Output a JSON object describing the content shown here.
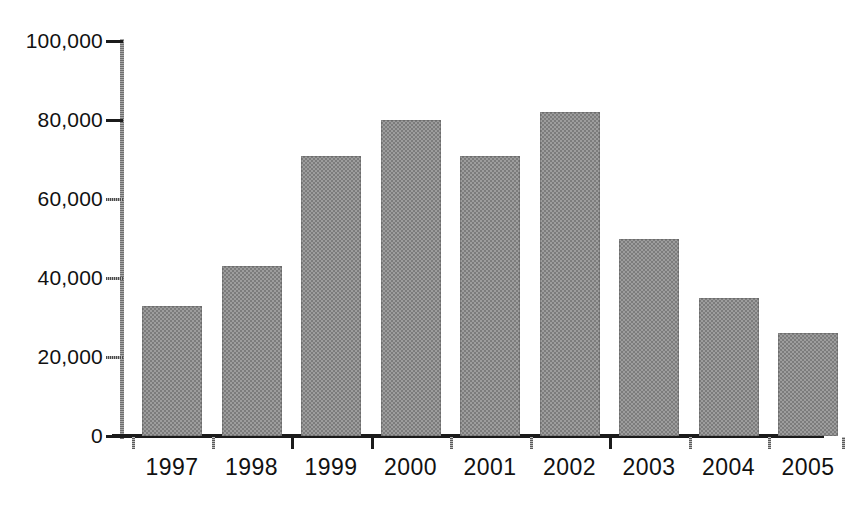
{
  "chart_data": {
    "type": "bar",
    "title": "",
    "subtitle": "",
    "xlabel": "",
    "ylabel": "",
    "categories": [
      "1997",
      "1998",
      "1999",
      "2000",
      "2001",
      "2002",
      "2003",
      "2004",
      "2005"
    ],
    "values": [
      33000,
      43000,
      71000,
      80000,
      71000,
      82000,
      50000,
      35000,
      26000
    ],
    "series": [
      {
        "name": "",
        "values": [
          33000,
          43000,
          71000,
          80000,
          71000,
          82000,
          50000,
          35000,
          26000
        ]
      }
    ],
    "ylim": [
      0,
      100000
    ],
    "ytick_values": [
      0,
      20000,
      40000,
      60000,
      80000,
      100000
    ],
    "ytick_labels": [
      "0",
      "20,000",
      "40,000",
      "60,000",
      "80,000",
      "100,000"
    ],
    "grid": false,
    "legend": false,
    "legend_position": "none",
    "bar_fill_color": "#8c8c8c",
    "axis_color": "#1b1b1b",
    "background_color": "#ffffff",
    "annotations": []
  },
  "axes": {
    "y_labels": [
      {
        "text": "100,000",
        "value": 100000
      },
      {
        "text": "80,000",
        "value": 80000
      },
      {
        "text": "60,000",
        "value": 60000
      },
      {
        "text": "40,000",
        "value": 40000
      },
      {
        "text": "20,000",
        "value": 20000
      },
      {
        "text": "0",
        "value": 0
      }
    ],
    "x_labels": [
      {
        "text": "1997"
      },
      {
        "text": "1998"
      },
      {
        "text": "1999"
      },
      {
        "text": "2000"
      },
      {
        "text": "2001"
      },
      {
        "text": "2002"
      },
      {
        "text": "2003"
      },
      {
        "text": "2004"
      },
      {
        "text": "2005"
      }
    ]
  }
}
